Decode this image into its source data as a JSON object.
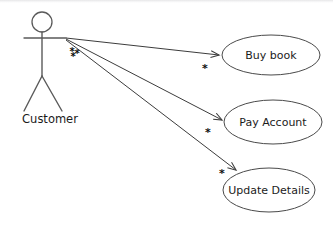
{
  "diagram": {
    "type": "uml-use-case-diagram",
    "canvas": {
      "width": 333,
      "height": 226,
      "background": "#ffffff"
    },
    "stroke_color": "#4a4a4a",
    "text_color": "#1b1b1b"
  },
  "actor": {
    "name": "Customer",
    "label_x": 50,
    "label_y": 119,
    "head": {
      "cx": 42,
      "cy": 22,
      "r": 10
    },
    "body": {
      "x1": 42,
      "y1": 32,
      "x2": 42,
      "y2": 76
    },
    "arms": {
      "x1": 24,
      "y1": 38,
      "x2": 66,
      "y2": 38
    },
    "leg_left": {
      "x1": 42,
      "y1": 76,
      "x2": 24,
      "y2": 111
    },
    "leg_right": {
      "x1": 42,
      "y1": 76,
      "x2": 62,
      "y2": 111
    }
  },
  "use_cases": [
    {
      "id": "buy-book",
      "label": "Buy book",
      "cx": 271,
      "cy": 55,
      "rx": 49,
      "ry": 20
    },
    {
      "id": "pay-account",
      "label": "Pay Account",
      "cx": 273,
      "cy": 122,
      "rx": 49,
      "ry": 22
    },
    {
      "id": "update-details",
      "label": "Update Details",
      "cx": 269,
      "cy": 190,
      "rx": 46,
      "ry": 22
    }
  ],
  "associations": [
    {
      "id": "customer-buy-book",
      "from": "Customer",
      "to": "Buy book",
      "x1": 66,
      "y1": 38,
      "x2": 221,
      "y2": 55,
      "multiplicity": "*",
      "mult_x": 205,
      "mult_y": 68
    },
    {
      "id": "customer-pay-account",
      "from": "Customer",
      "to": "Pay Account",
      "x1": 66,
      "y1": 39,
      "x2": 224,
      "y2": 120,
      "multiplicity": "*",
      "mult_x": 208,
      "mult_y": 132
    },
    {
      "id": "customer-update-details",
      "from": "Customer",
      "to": "Update Details",
      "x1": 66,
      "y1": 40,
      "x2": 238,
      "y2": 172,
      "multiplicity": "*",
      "mult_x": 222,
      "mult_y": 173
    }
  ],
  "actor_multiplicity": {
    "text": "*",
    "cluster": [
      "*",
      "*",
      "*"
    ],
    "x": 74,
    "y": 54
  }
}
